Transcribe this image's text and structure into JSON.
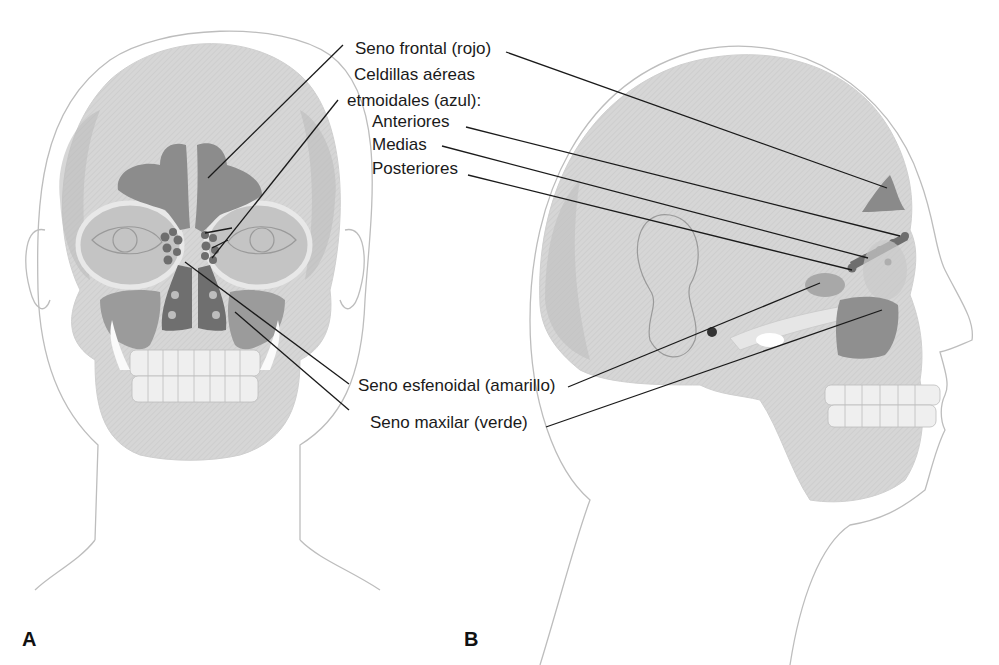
{
  "figure": {
    "panels": [
      {
        "letter": "A",
        "view": "frontal"
      },
      {
        "letter": "B",
        "view": "lateral"
      }
    ],
    "labels": {
      "frontal": "Seno frontal (rojo)",
      "ethmoid_line1": "Celdillas aéreas",
      "ethmoid_line2": "etmoidales (azul):",
      "anterior": "Anteriores",
      "middle": "Medias",
      "posterior": "Posteriores",
      "sphenoid": "Seno esfenoidal (amarillo)",
      "maxillary": "Seno maxilar (verde)"
    },
    "colors": {
      "skin_outline": "#b8b8b8",
      "bone": "#d9d9d9",
      "bone_shadow": "#bdbdbd",
      "sinus": "#8a8a8a",
      "sinus_dark": "#6e6e6e",
      "leader": "#1a1a1a"
    }
  }
}
